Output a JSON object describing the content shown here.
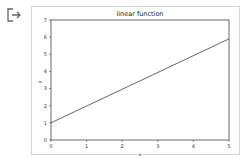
{
  "output_icon": "output-arrow-icon",
  "chart_data": {
    "type": "line",
    "title": "linear function",
    "xlabel": "x",
    "ylabel": "y",
    "xlim": [
      0,
      5
    ],
    "ylim": [
      0,
      7
    ],
    "xticks": [
      "0",
      "1",
      "2",
      "3",
      "4",
      "5"
    ],
    "yticks": [
      "0",
      "1",
      "2",
      "3",
      "4",
      "5",
      "6",
      "7"
    ],
    "grid": false,
    "legend": null,
    "series": [
      {
        "name": "y = x + 1",
        "x": [
          0,
          5
        ],
        "values": [
          1,
          5.9
        ],
        "color": "#555555"
      }
    ]
  }
}
